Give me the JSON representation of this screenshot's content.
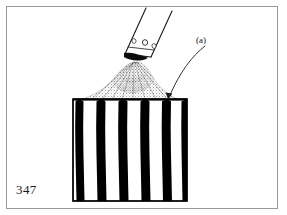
{
  "figure": {
    "page_number": "347",
    "callout_label": "(a)",
    "caption_text": "",
    "frame_border_color": "#9a9a9a",
    "background_color": "#ffffff",
    "ink_color": "#000000"
  },
  "illustration": {
    "title": "Spray nozzle depositing coating on striped block",
    "nozzle": {
      "name": "spray-nozzle",
      "hole_count": 3,
      "body_angle_degrees": 22,
      "outline_color": "#1a1a1a"
    },
    "spray_cone": {
      "name": "spray-cone",
      "stipple_color": "#000000",
      "dense_core_color": "#111111"
    },
    "block": {
      "name": "striped-block",
      "stripe_count": 6,
      "stripe_color": "#000000",
      "gap_color": "#ffffff",
      "outline_color": "#000000",
      "left": 72,
      "top": 98,
      "width": 116,
      "height": 103
    },
    "leader_line": {
      "name": "callout-leader-line",
      "from": "(a) label",
      "to": "block top surface",
      "color": "#1a1a1a"
    }
  }
}
